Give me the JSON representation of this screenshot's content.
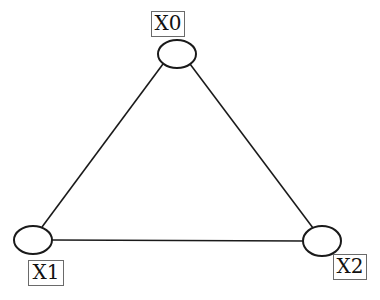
{
  "diagram": {
    "type": "graph",
    "nodes": [
      {
        "id": "X0",
        "label": "X0",
        "cx": 177,
        "cy": 54,
        "rx": 19,
        "ry": 14,
        "label_box": {
          "x": 151,
          "y": 11,
          "w": 34,
          "h": 26
        }
      },
      {
        "id": "X1",
        "label": "X1",
        "cx": 33,
        "cy": 240,
        "rx": 19,
        "ry": 14,
        "label_box": {
          "x": 28,
          "y": 260,
          "w": 36,
          "h": 26
        }
      },
      {
        "id": "X2",
        "label": "X2",
        "cx": 322,
        "cy": 241,
        "rx": 19,
        "ry": 15,
        "label_box": {
          "x": 333,
          "y": 254,
          "w": 34,
          "h": 26
        }
      }
    ],
    "edges": [
      {
        "from": "X0",
        "to": "X1"
      },
      {
        "from": "X0",
        "to": "X2"
      },
      {
        "from": "X1",
        "to": "X2"
      }
    ],
    "colors": {
      "stroke": "#1a1a1a",
      "label_border": "#6a6a6a",
      "background": "#ffffff"
    }
  }
}
